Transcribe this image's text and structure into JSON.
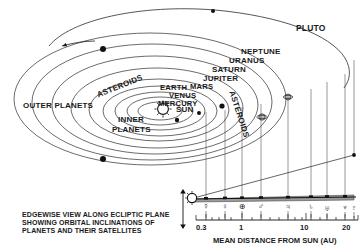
{
  "figure": {
    "axis_label": "MEAN DISTANCE FROM SUN (AU)",
    "caption_line1": "EDGEWISE VIEW ALONG ECLIPTIC PLANE",
    "caption_line2": "SHOWING ORBITAL INCLINATIONS OF",
    "caption_line3": "PLANETS AND THEIR SATELLITES",
    "sun_label": "SUN"
  },
  "orbit_labels": [
    {
      "id": "pluto",
      "text": "PLUTO",
      "x": 296,
      "y": 24,
      "size": 8.5
    },
    {
      "id": "neptune",
      "text": "NEPTUNE",
      "x": 241,
      "y": 48,
      "size": 8.0
    },
    {
      "id": "uranus",
      "text": "URANUS",
      "x": 229,
      "y": 57,
      "size": 8.0
    },
    {
      "id": "saturn",
      "text": "SATURN",
      "x": 212,
      "y": 66,
      "size": 8.0
    },
    {
      "id": "jupiter",
      "text": "JUPITER",
      "x": 203,
      "y": 75,
      "size": 8.0
    },
    {
      "id": "earth",
      "text": "EARTH",
      "x": 160,
      "y": 84,
      "size": 7.6
    },
    {
      "id": "mars",
      "text": "MARS",
      "x": 190,
      "y": 83,
      "size": 7.6
    },
    {
      "id": "venus",
      "text": "VENUS",
      "x": 169,
      "y": 92,
      "size": 7.6
    },
    {
      "id": "mercury",
      "text": "MERCURY",
      "x": 158,
      "y": 100,
      "size": 7.6
    },
    {
      "id": "outer-planets",
      "text": "OUTER PLANETS",
      "x": 23,
      "y": 102,
      "size": 8.0
    },
    {
      "id": "inner",
      "text": "INNER",
      "x": 118,
      "y": 116,
      "size": 8.0
    },
    {
      "id": "planets",
      "text": "PLANETS",
      "x": 112,
      "y": 126,
      "size": 8.0
    }
  ],
  "rotated_labels": [
    {
      "id": "asteroids-left",
      "text": "ASTEROIDS",
      "x": 96,
      "y": 92,
      "rot": -22,
      "size": 8.0
    },
    {
      "id": "asteroids-right",
      "text": "ASTEROIDS",
      "x": 235,
      "y": 90,
      "rot": 72,
      "size": 8.0
    }
  ],
  "scale": {
    "symbols": [
      {
        "id": "mercury-symbol",
        "glyph": "☿",
        "x": 206
      },
      {
        "id": "venus-symbol",
        "glyph": "♀",
        "x": 225
      },
      {
        "id": "earth-symbol",
        "glyph": "⊕",
        "x": 242
      },
      {
        "id": "mars-symbol",
        "glyph": "♂",
        "x": 261
      },
      {
        "id": "jupiter-symbol",
        "glyph": "♃",
        "x": 288
      },
      {
        "id": "saturn-symbol",
        "glyph": "♄",
        "x": 311
      },
      {
        "id": "uranus-symbol",
        "glyph": "♅",
        "x": 327
      },
      {
        "id": "neptune-symbol",
        "glyph": "♆",
        "x": 345
      },
      {
        "id": "pluto-symbol",
        "glyph": "♇",
        "x": 354
      }
    ],
    "ticks": [
      {
        "id": "tick-0-3",
        "text": "0.3",
        "x": 202
      },
      {
        "id": "tick-1",
        "text": "1",
        "x": 239
      },
      {
        "id": "tick-10",
        "text": "10",
        "x": 303
      },
      {
        "id": "tick-20",
        "text": "20",
        "x": 345
      }
    ]
  },
  "colors": {
    "ink": "#1a1a1a",
    "line": "#333333",
    "background": "#ffffff"
  }
}
